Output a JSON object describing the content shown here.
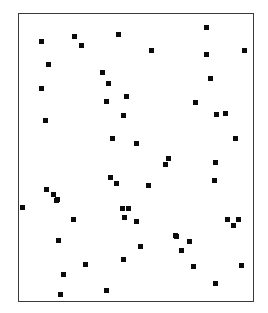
{
  "figure": {
    "background_color": "#ffffff",
    "frame_color": "#3a3a3a",
    "marker_color": "#0b0b0b",
    "marker_shape": "square",
    "marker_size_px": 5
  },
  "chart_data": {
    "type": "scatter",
    "title": "",
    "subtitle": "",
    "xlabel": "",
    "ylabel": "",
    "xlim": [
      0,
      236
    ],
    "ylim": [
      0,
      289
    ],
    "grid": false,
    "legend": null,
    "annotations": [],
    "tick_labels": {
      "x": [],
      "y": []
    },
    "axis_visible": false,
    "frame_visible": true,
    "series": [
      {
        "name": "points",
        "marker": "square",
        "color": "#0b0b0b",
        "n": 62,
        "points": [
          [
            41,
            41
          ],
          [
            74,
            36
          ],
          [
            81,
            45
          ],
          [
            118,
            34
          ],
          [
            206,
            27
          ],
          [
            48,
            64
          ],
          [
            151,
            50
          ],
          [
            244,
            50
          ],
          [
            206,
            54
          ],
          [
            41,
            88
          ],
          [
            102,
            72
          ],
          [
            108,
            83
          ],
          [
            210,
            78
          ],
          [
            126,
            96
          ],
          [
            106,
            101
          ],
          [
            195,
            102
          ],
          [
            45,
            120
          ],
          [
            123,
            115
          ],
          [
            216,
            114
          ],
          [
            225,
            113
          ],
          [
            112,
            138
          ],
          [
            136,
            143
          ],
          [
            235,
            138
          ],
          [
            168,
            158
          ],
          [
            165,
            164
          ],
          [
            215,
            162
          ],
          [
            110,
            177
          ],
          [
            116,
            183
          ],
          [
            148,
            185
          ],
          [
            214,
            180
          ],
          [
            46,
            189
          ],
          [
            53,
            194
          ],
          [
            57,
            199
          ],
          [
            56,
            200
          ],
          [
            22,
            207
          ],
          [
            122,
            208
          ],
          [
            128,
            208
          ],
          [
            73,
            219
          ],
          [
            124,
            217
          ],
          [
            136,
            221
          ],
          [
            227,
            219
          ],
          [
            238,
            219
          ],
          [
            233,
            225
          ],
          [
            58,
            240
          ],
          [
            175,
            235
          ],
          [
            176,
            236
          ],
          [
            189,
            241
          ],
          [
            140,
            246
          ],
          [
            181,
            250
          ],
          [
            123,
            259
          ],
          [
            85,
            264
          ],
          [
            193,
            266
          ],
          [
            241,
            265
          ],
          [
            63,
            274
          ],
          [
            60,
            294
          ],
          [
            106,
            290
          ],
          [
            215,
            283
          ]
        ]
      }
    ]
  }
}
